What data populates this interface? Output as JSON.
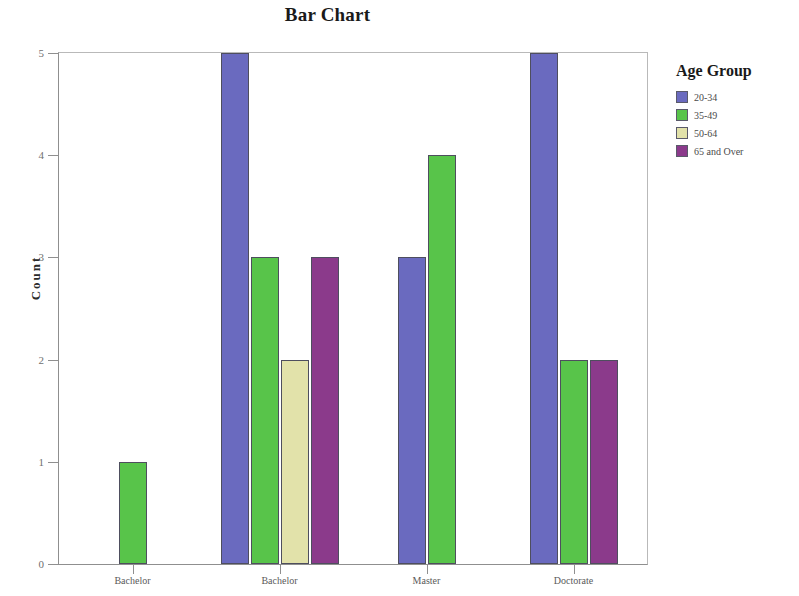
{
  "chart_data": {
    "type": "bar",
    "title": "Bar Chart",
    "xlabel": "",
    "ylabel": "Count",
    "ylim": [
      0,
      5
    ],
    "yticks": [
      "0",
      "1",
      "2",
      "3",
      "4",
      "5"
    ],
    "grid": false,
    "legend_title": "Age Group",
    "legend_position": "right",
    "categories": [
      "Bachelor",
      "Bachelor",
      "Master",
      "Doctorate"
    ],
    "series": [
      {
        "name": "20-34",
        "color": "#6A6ABF",
        "values": [
          0,
          5,
          3,
          5
        ]
      },
      {
        "name": "35-49",
        "color": "#58C44A",
        "values": [
          1,
          3,
          4,
          2
        ]
      },
      {
        "name": "50-64",
        "color": "#E2E2AA",
        "values": [
          0,
          2,
          0,
          0
        ]
      },
      {
        "name": "65 and Over",
        "color": "#8B3A8B",
        "values": [
          0,
          3,
          0,
          2
        ]
      }
    ]
  },
  "axis": {
    "y_label": "Count",
    "y_ticks": [
      "5",
      "4",
      "3",
      "2",
      "1",
      "0"
    ]
  },
  "legend": {
    "title": "Age Group",
    "entries": [
      {
        "label": "20-34",
        "color": "#6A6ABF"
      },
      {
        "label": "35-49",
        "color": "#58C44A"
      },
      {
        "label": "50-64",
        "color": "#E2E2AA"
      },
      {
        "label": "65 and Over",
        "color": "#8B3A8B"
      }
    ]
  }
}
